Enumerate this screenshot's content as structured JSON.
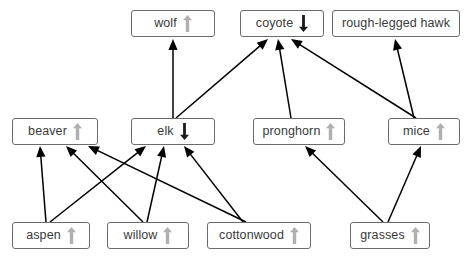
{
  "diagram": {
    "type": "food-web",
    "title": "",
    "background_color": "#ffffff",
    "box_border_color": "#6b6b6b",
    "edge_color": "#000000",
    "trend_up_color": "#b0b0b0",
    "trend_down_color": "#1a1a1a",
    "legend": {
      "up_arrow_meaning": "population increased",
      "down_arrow_meaning": "population decreased"
    },
    "nodes": [
      {
        "id": "wolf",
        "label": "wolf",
        "trend": "up",
        "tier": "top",
        "x": 131,
        "y": 10,
        "w": 84
      },
      {
        "id": "coyote",
        "label": "coyote",
        "trend": "down",
        "tier": "top",
        "x": 240,
        "y": 10,
        "w": 84
      },
      {
        "id": "hawk",
        "label": "rough-legged hawk",
        "trend": "none",
        "tier": "top",
        "x": 332,
        "y": 10,
        "w": 128
      },
      {
        "id": "beaver",
        "label": "beaver",
        "trend": "up",
        "tier": "middle",
        "x": 12,
        "y": 118,
        "w": 86
      },
      {
        "id": "elk",
        "label": "elk",
        "trend": "down",
        "tier": "middle",
        "x": 131,
        "y": 118,
        "w": 84
      },
      {
        "id": "pronghorn",
        "label": "pronghorn",
        "trend": "up",
        "tier": "middle",
        "x": 253,
        "y": 118,
        "w": 92
      },
      {
        "id": "mice",
        "label": "mice",
        "trend": "up",
        "tier": "middle",
        "x": 388,
        "y": 118,
        "w": 72
      },
      {
        "id": "aspen",
        "label": "aspen",
        "trend": "up",
        "tier": "bottom",
        "x": 12,
        "y": 222,
        "w": 78
      },
      {
        "id": "willow",
        "label": "willow",
        "trend": "up",
        "tier": "bottom",
        "x": 107,
        "y": 222,
        "w": 82
      },
      {
        "id": "cottonwood",
        "label": "cottonwood",
        "trend": "up",
        "tier": "bottom",
        "x": 207,
        "y": 222,
        "w": 104
      },
      {
        "id": "grasses",
        "label": "grasses",
        "trend": "up",
        "tier": "bottom",
        "x": 350,
        "y": 222,
        "w": 80
      }
    ],
    "edges": [
      {
        "from": "elk",
        "to": "wolf",
        "x1": 173,
        "y1": 118,
        "x2": 173,
        "y2": 39
      },
      {
        "from": "elk",
        "to": "coyote",
        "x1": 176,
        "y1": 118,
        "x2": 268,
        "y2": 39
      },
      {
        "from": "pronghorn",
        "to": "coyote",
        "x1": 291,
        "y1": 118,
        "x2": 278,
        "y2": 39
      },
      {
        "from": "mice",
        "to": "coyote",
        "x1": 416,
        "y1": 118,
        "x2": 291,
        "y2": 39
      },
      {
        "from": "mice",
        "to": "hawk",
        "x1": 414,
        "y1": 118,
        "x2": 395,
        "y2": 39
      },
      {
        "from": "aspen",
        "to": "beaver",
        "x1": 46,
        "y1": 222,
        "x2": 40,
        "y2": 146
      },
      {
        "from": "aspen",
        "to": "elk",
        "x1": 50,
        "y1": 222,
        "x2": 146,
        "y2": 146
      },
      {
        "from": "willow",
        "to": "beaver",
        "x1": 143,
        "y1": 222,
        "x2": 66,
        "y2": 146
      },
      {
        "from": "willow",
        "to": "elk",
        "x1": 147,
        "y1": 222,
        "x2": 164,
        "y2": 146
      },
      {
        "from": "cottonwood",
        "to": "beaver",
        "x1": 246,
        "y1": 222,
        "x2": 88,
        "y2": 146
      },
      {
        "from": "cottonwood",
        "to": "elk",
        "x1": 243,
        "y1": 222,
        "x2": 184,
        "y2": 146
      },
      {
        "from": "grasses",
        "to": "pronghorn",
        "x1": 383,
        "y1": 222,
        "x2": 305,
        "y2": 146
      },
      {
        "from": "grasses",
        "to": "mice",
        "x1": 388,
        "y1": 222,
        "x2": 421,
        "y2": 146
      }
    ]
  }
}
